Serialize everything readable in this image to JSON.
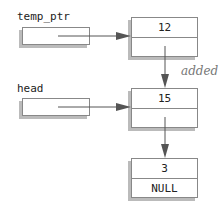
{
  "pointers": [
    {
      "name": "temp_ptr"
    },
    {
      "name": "head"
    }
  ],
  "nodes": [
    {
      "value": "12",
      "next": ""
    },
    {
      "value": "15",
      "next": ""
    },
    {
      "value": "3",
      "next": "NULL"
    }
  ],
  "annotation": "added",
  "colors": {
    "border": "#888888",
    "shadow": "#bbbbbb",
    "arrow": "#555555"
  }
}
